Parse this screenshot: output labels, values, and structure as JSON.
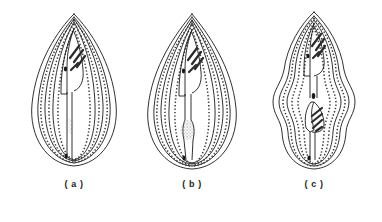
{
  "plate": {
    "title": "Pollen grain outline drawings",
    "background_color": "#ffffff",
    "ink_color": "#1a1a1a",
    "stipple_color": "#5a5a5a",
    "width": 382,
    "height": 222
  },
  "panels": [
    {
      "id": "a",
      "caption": "( a )",
      "shape_name": "ovate-pollen-grain",
      "outline_description": "broad ovate grain, pointed apex, rounded base",
      "ribs": 10,
      "aperture_hatch_lines": 4,
      "markings": [
        "apical-hatched-aperture",
        "dark-dot-below-aperture",
        "stipple-patch-mid-body",
        "basal-dark-dot"
      ]
    },
    {
      "id": "b",
      "caption": "( b )",
      "shape_name": "ovate-pollen-grain-with-stipple-mass",
      "outline_description": "ovate grain, pointed apex, broad rounded base",
      "ribs": 10,
      "aperture_hatch_lines": 4,
      "markings": [
        "apical-hatched-aperture",
        "dark-dot-below-aperture",
        "large-stipple-mass-mid-body",
        "basal-dark-dot"
      ]
    },
    {
      "id": "c",
      "caption": "( c )",
      "shape_name": "lobed-pollen-grain",
      "outline_description": "elongate grain with wavy constricted lobed margin",
      "ribs": 10,
      "aperture_hatch_lines": 4,
      "markings": [
        "apical-hatched-aperture",
        "dark-dot-upper-body",
        "second-hatched-aperture-mid-body",
        "basal-dark-dot"
      ]
    }
  ]
}
